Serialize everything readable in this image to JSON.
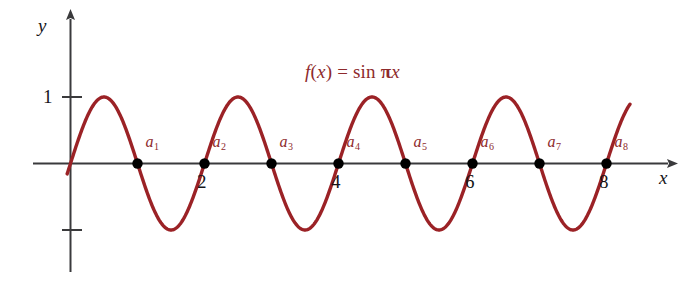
{
  "chart_data": {
    "type": "line",
    "title": "",
    "function_label": "f(x) = sin πx",
    "function_label_parts": {
      "f": "f",
      "open": "(",
      "var": "x",
      "close": ")",
      "equals": "=",
      "sin": "sin",
      "pi": "π",
      "arg": "x"
    },
    "expression": "sin(pi*x)",
    "xlabel": "x",
    "ylabel": "y",
    "xlim": [
      -0.55,
      9.0
    ],
    "ylim": [
      -1.55,
      1.8
    ],
    "grid": false,
    "legend": null,
    "x_tick_labels": [
      "2",
      "4",
      "6",
      "8"
    ],
    "x_tick_values": [
      2,
      4,
      6,
      8
    ],
    "y_tick_labels": [
      "1",
      ""
    ],
    "y_tick_values": [
      1,
      -1
    ],
    "curve_color": "#9b2226",
    "axis_color": "#3a3a3c",
    "point_color": "#000000",
    "label_color": "#8e2a2c",
    "x_domain_drawn": [
      -0.05,
      8.35
    ],
    "points": [
      {
        "label": "a",
        "sub": "1",
        "x": 1,
        "y": 0
      },
      {
        "label": "a",
        "sub": "2",
        "x": 2,
        "y": 0
      },
      {
        "label": "a",
        "sub": "3",
        "x": 3,
        "y": 0
      },
      {
        "label": "a",
        "sub": "4",
        "x": 4,
        "y": 0
      },
      {
        "label": "a",
        "sub": "5",
        "x": 5,
        "y": 0
      },
      {
        "label": "a",
        "sub": "6",
        "x": 6,
        "y": 0
      },
      {
        "label": "a",
        "sub": "7",
        "x": 7,
        "y": 0
      },
      {
        "label": "a",
        "sub": "8",
        "x": 8,
        "y": 0
      }
    ],
    "maxima": [
      {
        "x": 0.5,
        "y": 1
      },
      {
        "x": 2.5,
        "y": 1
      },
      {
        "x": 4.5,
        "y": 1
      },
      {
        "x": 6.5,
        "y": 1
      }
    ],
    "minima": [
      {
        "x": 1.5,
        "y": -1
      },
      {
        "x": 3.5,
        "y": -1
      },
      {
        "x": 5.5,
        "y": -1
      },
      {
        "x": 7.5,
        "y": -1
      }
    ]
  }
}
